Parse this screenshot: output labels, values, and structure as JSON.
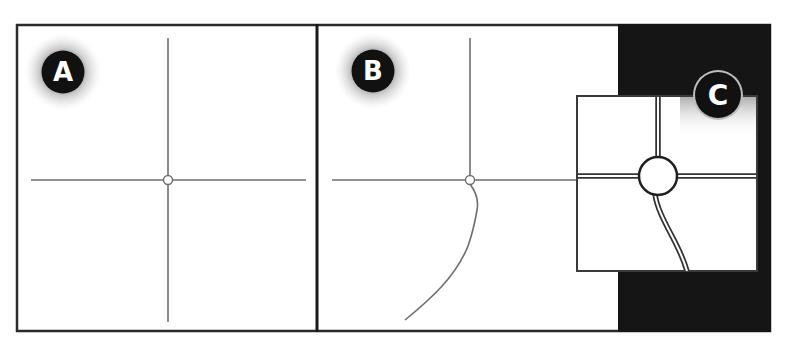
{
  "figure": {
    "colors": {
      "background": "#ffffff",
      "frame": "#2a2a2a",
      "line": "#6e6e6e",
      "badge_fill": "#111111",
      "badge_text": "#ffffff",
      "badge_ring": "#bdbdbd",
      "glow": "#8a8a8a",
      "dark_panel": "#151515",
      "road_outline": "#333333",
      "road_core": "#ffffff"
    }
  },
  "panels": [
    {
      "id": "A",
      "label": "A",
      "content": "Straight crossroad with small node at intersection"
    },
    {
      "id": "B",
      "label": "B",
      "content": "Crossroad with a curved branch leaving the node downward-left"
    },
    {
      "id": "C",
      "label": "C",
      "content": "Zoomed inset showing roundabout with double-line roads"
    }
  ]
}
